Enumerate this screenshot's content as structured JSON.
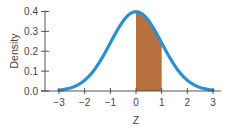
{
  "chart_data": {
    "type": "area",
    "title": "",
    "xlabel": "Z",
    "ylabel": "Density",
    "xlim": [
      -3,
      3
    ],
    "ylim": [
      0,
      0.4
    ],
    "x_ticks": [
      -3,
      -2,
      -1,
      0,
      1,
      2,
      3
    ],
    "x_tick_labels": [
      "−3",
      "−2",
      "−1",
      "0",
      "1",
      "2",
      "3"
    ],
    "y_ticks": [
      0.0,
      0.1,
      0.2,
      0.3,
      0.4
    ],
    "y_tick_labels": [
      "0.0",
      "0.1",
      "0.2",
      "0.3",
      "0.4"
    ],
    "grid": false,
    "legend": null,
    "series": [
      {
        "name": "Standard normal density",
        "function": "normal_pdf(mean=0, sd=1)",
        "x": [
          -3,
          -2.5,
          -2,
          -1.5,
          -1,
          -0.5,
          0,
          0.5,
          1,
          1.5,
          2,
          2.5,
          3
        ],
        "values": [
          0.0044,
          0.0175,
          0.054,
          0.1295,
          0.242,
          0.3521,
          0.3989,
          0.3521,
          0.242,
          0.1295,
          0.054,
          0.0175,
          0.0044
        ],
        "color": "#2b8fd0"
      }
    ],
    "shaded_region": {
      "from": 0,
      "to": 1,
      "color": "#b8703e"
    }
  }
}
